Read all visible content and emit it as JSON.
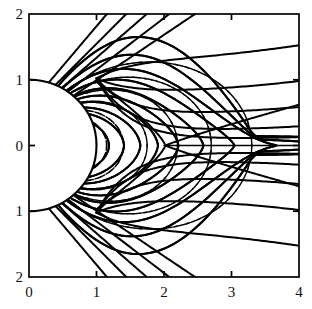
{
  "figure": {
    "kind": "field-line-plot",
    "box": {
      "x_px": 29,
      "y_px": 14,
      "w_px": 270,
      "h_px": 263
    }
  },
  "axes": {
    "x": {
      "label": "",
      "min": 0,
      "max": 4,
      "ticks": [
        0,
        1,
        2,
        3,
        4
      ],
      "tick_labels": [
        "0",
        "1",
        "2",
        "3",
        "4"
      ],
      "tick_side": "inward",
      "labelled_edge": "bottom"
    },
    "y": {
      "label": "",
      "min": -2,
      "max": 2,
      "ticks": [
        2,
        1,
        0,
        -1,
        -2
      ],
      "tick_labels": [
        "2",
        "1",
        "0",
        "1",
        "2"
      ],
      "tick_side": "inward",
      "labelled_edge": "left"
    },
    "frame": true,
    "grid": false
  },
  "chart_data": {
    "type": "line",
    "title": "",
    "xlabel": "",
    "ylabel": "",
    "xlim": [
      0,
      4
    ],
    "ylim": [
      -2,
      2
    ],
    "grid": false,
    "legend": "none",
    "body": {
      "name": "planet-half-disc",
      "center": [
        0,
        0
      ],
      "radius": 1,
      "half": "right"
    },
    "neutral_point": {
      "x": 2.02,
      "y": 0
    },
    "series": [
      {
        "name": "deformed-field-lines",
        "style": "solid",
        "color": "#000000",
        "width_px": 2.0,
        "count": 24,
        "note": "Open polar lines leave the top/bottom frame; closed lines stretch tailward and converge on the neutral line near x=2."
      },
      {
        "name": "dipole-field-lines",
        "style": "dashed",
        "color": "#000000",
        "width_px": 1.4,
        "dash": "7,5",
        "count": 12,
        "note": "Undeformed dipole L-shells L = 1.15, 1.4, 1.75, 2.2, 2.7, 3.3 drawn in both hemispheres."
      }
    ],
    "dipole_shells_L": [
      1.15,
      1.4,
      1.75,
      2.2,
      2.7,
      3.3
    ],
    "solid_colatitudes_deg": [
      18,
      24,
      30,
      36,
      42,
      48,
      54,
      60,
      66,
      72,
      78,
      84
    ],
    "top_edge_crossings_x": [
      0.55,
      0.85,
      1.15,
      1.55
    ],
    "tail_asymptote_y": [
      0.08,
      0.2,
      0.45,
      0.8,
      1.3
    ]
  },
  "tick_text": {
    "x": [
      "0",
      "1",
      "2",
      "3",
      "4"
    ],
    "y_top_to_bottom": [
      "2",
      "1",
      "0",
      "1",
      "2"
    ]
  }
}
